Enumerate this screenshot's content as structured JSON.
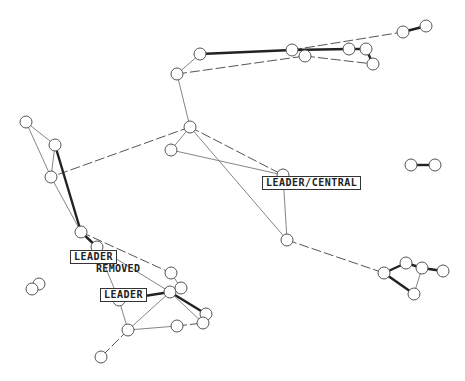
{
  "diagram": {
    "type": "network-graph",
    "background": "#ffffff",
    "node_radius": 6,
    "labels": [
      {
        "id": "leader-central",
        "text": "LEADER/CENTRAL",
        "x": 262,
        "y": 176,
        "boxed": true
      },
      {
        "id": "leader-removed",
        "text": "LEADER",
        "x": 70,
        "y": 250,
        "boxed": true
      },
      {
        "id": "removed",
        "text": "REMOVED",
        "x": 96,
        "y": 263,
        "boxed": false
      },
      {
        "id": "leader",
        "text": "LEADER",
        "x": 100,
        "y": 288,
        "boxed": true
      }
    ],
    "nodes": [
      {
        "id": "n1",
        "x": 200,
        "y": 54
      },
      {
        "id": "n2",
        "x": 177,
        "y": 74
      },
      {
        "id": "n3",
        "x": 292,
        "y": 50
      },
      {
        "id": "n4",
        "x": 305,
        "y": 56
      },
      {
        "id": "n5",
        "x": 349,
        "y": 49
      },
      {
        "id": "n6",
        "x": 366,
        "y": 49
      },
      {
        "id": "n7",
        "x": 373,
        "y": 64
      },
      {
        "id": "n8",
        "x": 403,
        "y": 32
      },
      {
        "id": "n9",
        "x": 426,
        "y": 26
      },
      {
        "id": "n10",
        "x": 190,
        "y": 127
      },
      {
        "id": "n11",
        "x": 171,
        "y": 150
      },
      {
        "id": "n12",
        "x": 26,
        "y": 122
      },
      {
        "id": "n13",
        "x": 55,
        "y": 145
      },
      {
        "id": "n14",
        "x": 51,
        "y": 177
      },
      {
        "id": "n15",
        "x": 411,
        "y": 165
      },
      {
        "id": "n16",
        "x": 435,
        "y": 165
      },
      {
        "id": "n17",
        "x": 283,
        "y": 175
      },
      {
        "id": "n18",
        "x": 287,
        "y": 240
      },
      {
        "id": "n19",
        "x": 81,
        "y": 232
      },
      {
        "id": "n20",
        "x": 97,
        "y": 247
      },
      {
        "id": "n21",
        "x": 171,
        "y": 273
      },
      {
        "id": "n22",
        "x": 170,
        "y": 292
      },
      {
        "id": "n23",
        "x": 181,
        "y": 288
      },
      {
        "id": "n24",
        "x": 119,
        "y": 300
      },
      {
        "id": "n25",
        "x": 206,
        "y": 314
      },
      {
        "id": "n26",
        "x": 203,
        "y": 323
      },
      {
        "id": "n27",
        "x": 177,
        "y": 326
      },
      {
        "id": "n28",
        "x": 128,
        "y": 330
      },
      {
        "id": "n29",
        "x": 101,
        "y": 357
      },
      {
        "id": "n30",
        "x": 39,
        "y": 284
      },
      {
        "id": "n31",
        "x": 32,
        "y": 289
      },
      {
        "id": "n32",
        "x": 384,
        "y": 273
      },
      {
        "id": "n33",
        "x": 406,
        "y": 263
      },
      {
        "id": "n34",
        "x": 422,
        "y": 268
      },
      {
        "id": "n35",
        "x": 443,
        "y": 271
      },
      {
        "id": "n36",
        "x": 414,
        "y": 294
      }
    ],
    "edges": [
      {
        "a": "n1",
        "b": "n3",
        "style": "thick"
      },
      {
        "a": "n1",
        "b": "n2",
        "style": "thin"
      },
      {
        "a": "n2",
        "b": "n4",
        "style": "dash"
      },
      {
        "a": "n3",
        "b": "n8",
        "style": "dash"
      },
      {
        "a": "n8",
        "b": "n9",
        "style": "thick"
      },
      {
        "a": "n3",
        "b": "n5",
        "style": "thick"
      },
      {
        "a": "n4",
        "b": "n7",
        "style": "dash"
      },
      {
        "a": "n5",
        "b": "n6",
        "style": "thick"
      },
      {
        "a": "n6",
        "b": "n7",
        "style": "thick"
      },
      {
        "a": "n2",
        "b": "n10",
        "style": "thin"
      },
      {
        "a": "n10",
        "b": "n11",
        "style": "thin"
      },
      {
        "a": "n10",
        "b": "n14",
        "style": "dash"
      },
      {
        "a": "n10",
        "b": "n17",
        "style": "dash"
      },
      {
        "a": "n10",
        "b": "n18",
        "style": "thin"
      },
      {
        "a": "n11",
        "b": "n17",
        "style": "thin"
      },
      {
        "a": "n17",
        "b": "n18",
        "style": "thin"
      },
      {
        "a": "n18",
        "b": "n32",
        "style": "dash"
      },
      {
        "a": "n12",
        "b": "n13",
        "style": "thin"
      },
      {
        "a": "n12",
        "b": "n14",
        "style": "thin"
      },
      {
        "a": "n13",
        "b": "n14",
        "style": "thin"
      },
      {
        "a": "n13",
        "b": "n19",
        "style": "thick"
      },
      {
        "a": "n14",
        "b": "n19",
        "style": "thin"
      },
      {
        "a": "n15",
        "b": "n16",
        "style": "thick"
      },
      {
        "a": "n19",
        "b": "n20",
        "style": "thick"
      },
      {
        "a": "n19",
        "b": "n21",
        "style": "dash"
      },
      {
        "a": "n20",
        "b": "n22",
        "style": "thin"
      },
      {
        "a": "n20",
        "b": "n24",
        "style": "thin"
      },
      {
        "a": "n21",
        "b": "n23",
        "style": "thin"
      },
      {
        "a": "n22",
        "b": "n24",
        "style": "thick"
      },
      {
        "a": "n22",
        "b": "n25",
        "style": "thick"
      },
      {
        "a": "n22",
        "b": "n26",
        "style": "thin"
      },
      {
        "a": "n22",
        "b": "n28",
        "style": "thin"
      },
      {
        "a": "n24",
        "b": "n28",
        "style": "thin"
      },
      {
        "a": "n28",
        "b": "n27",
        "style": "thin"
      },
      {
        "a": "n27",
        "b": "n26",
        "style": "dash"
      },
      {
        "a": "n28",
        "b": "n29",
        "style": "dash"
      },
      {
        "a": "n32",
        "b": "n33",
        "style": "thick"
      },
      {
        "a": "n33",
        "b": "n34",
        "style": "thick"
      },
      {
        "a": "n34",
        "b": "n35",
        "style": "thick"
      },
      {
        "a": "n32",
        "b": "n36",
        "style": "thick"
      },
      {
        "a": "n34",
        "b": "n36",
        "style": "thin"
      }
    ]
  }
}
